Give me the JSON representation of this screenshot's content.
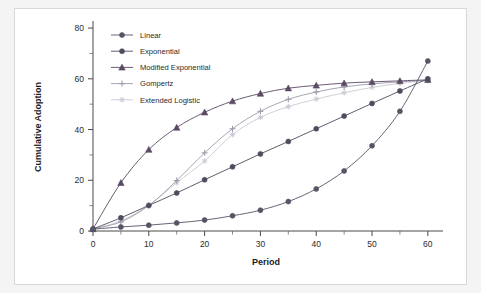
{
  "figure": {
    "background_color": "#f4f4f4",
    "panel_color": "#ffffff",
    "border_color": "#d8d8d8"
  },
  "chart_data": {
    "type": "line",
    "title": "",
    "xlabel": "Period",
    "ylabel": "Cumulative Adoption",
    "xlim": [
      0,
      62
    ],
    "ylim": [
      0,
      82
    ],
    "xticks": [
      0,
      10,
      20,
      30,
      40,
      50,
      60
    ],
    "yticks": [
      0,
      20,
      40,
      60,
      80
    ],
    "xtick_labels": [
      "0",
      "10",
      "20",
      "30",
      "40",
      "50",
      "60"
    ],
    "ytick_labels": [
      "0",
      "20",
      "40",
      "60",
      "80"
    ],
    "xminor_ticks": [
      5,
      15,
      25,
      35,
      45,
      55
    ],
    "yminor_ticks": [
      10,
      30,
      50,
      70
    ],
    "grid": false,
    "legend_position": "top-left",
    "x": [
      0,
      5,
      10,
      15,
      20,
      25,
      30,
      35,
      40,
      45,
      50,
      55,
      60
    ],
    "series": [
      {
        "name": "Linear",
        "marker": "circle",
        "color": "#555566",
        "values": [
          0.7,
          1.6,
          2.3,
          3.2,
          4.3,
          6.0,
          8.2,
          11.6,
          16.6,
          23.7,
          33.6,
          47.2,
          67.0
        ]
      },
      {
        "name": "Exponential",
        "marker": "circle",
        "color": "#4d4d5e",
        "values": [
          0.8,
          5.2,
          10.1,
          15.0,
          20.2,
          25.3,
          30.4,
          35.3,
          40.3,
          45.3,
          50.3,
          55.2,
          60.0
        ]
      },
      {
        "name": "Modified Exponential",
        "marker": "triangle",
        "color": "#5b4a63",
        "values": [
          0.8,
          19.0,
          32.1,
          40.8,
          46.8,
          51.2,
          54.2,
          56.3,
          57.4,
          58.3,
          58.8,
          59.2,
          59.6
        ]
      },
      {
        "name": "Gompertz",
        "marker": "plus",
        "color": "#9b9bab",
        "values": [
          0.8,
          3.6,
          10.0,
          19.9,
          30.8,
          40.3,
          47.2,
          51.9,
          54.8,
          56.8,
          58.0,
          58.8,
          59.4
        ]
      },
      {
        "name": "Extended Logistic",
        "marker": "asterisk",
        "color": "#cacad4",
        "values": [
          0.8,
          4.0,
          10.2,
          19.0,
          27.6,
          38.0,
          44.8,
          49.0,
          52.0,
          54.5,
          56.6,
          58.2,
          59.4
        ]
      }
    ]
  },
  "legend": {
    "items": [
      {
        "label": "Linear"
      },
      {
        "label": "Exponential"
      },
      {
        "label": "Modified Exponential"
      },
      {
        "label": "Gompertz"
      },
      {
        "label": "Extended Logistic"
      }
    ]
  }
}
